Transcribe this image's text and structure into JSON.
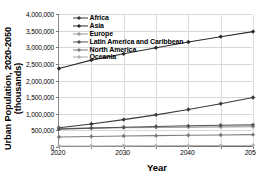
{
  "chart_data": {
    "type": "line",
    "title": "",
    "xlabel": "Year",
    "ylabel": "Urban Population, 2020-2050 (thousands)",
    "ylabel_line1": "Urban Population, 2020-2050",
    "ylabel_line2": "(thousands)",
    "x": [
      2020,
      2025,
      2030,
      2035,
      2040,
      2045,
      2050
    ],
    "xlim": [
      2020,
      2050
    ],
    "ylim": [
      0,
      4000000
    ],
    "xticks": [
      2020,
      2025,
      2030,
      2035,
      2040,
      2045,
      2050
    ],
    "xtick_labels": [
      "2020",
      "",
      "2030",
      "",
      "2040",
      "",
      "2050"
    ],
    "yticks": [
      0,
      500000,
      1000000,
      1500000,
      2000000,
      2500000,
      3000000,
      3500000,
      4000000
    ],
    "ytick_labels": [
      "0",
      "500,000",
      "1,000,000",
      "1,500,000",
      "2,000,000",
      "2,500,000",
      "3,000,000",
      "3,500,000",
      "4,000,000"
    ],
    "grid": true,
    "legend_position": "top-left-inside",
    "series": [
      {
        "name": "Africa",
        "color": "#3a3a3a",
        "values": [
          578000,
          690000,
          824000,
          967000,
          1126000,
          1303000,
          1489000
        ]
      },
      {
        "name": "Asia",
        "color": "#2b2b2b",
        "values": [
          2361000,
          2613000,
          2802000,
          2985000,
          3157000,
          3318000,
          3470000
        ]
      },
      {
        "name": "Europe",
        "color": "#9a9a9a",
        "values": [
          557000,
          569000,
          581000,
          591000,
          598000,
          604000,
          609000
        ]
      },
      {
        "name": "Latin America and Caribbean",
        "color": "#555555",
        "values": [
          538000,
          568000,
          595000,
          618000,
          637000,
          653000,
          664000
        ]
      },
      {
        "name": "North America",
        "color": "#7d7d7d",
        "values": [
          301000,
          315000,
          329000,
          341000,
          352000,
          362000,
          371000
        ]
      },
      {
        "name": "Oceania",
        "color": "#b0b0b0",
        "values": [
          29000,
          32000,
          35000,
          38000,
          41000,
          43000,
          46000
        ]
      }
    ]
  }
}
